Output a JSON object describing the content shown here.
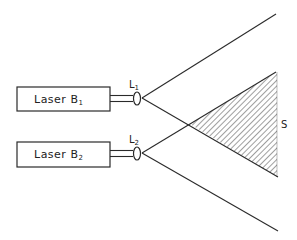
{
  "diagram": {
    "lasers": [
      {
        "name": "Laser B",
        "subscript": "1"
      },
      {
        "name": "Laser B",
        "subscript": "2"
      }
    ],
    "lenses": [
      {
        "name": "L",
        "subscript": "1"
      },
      {
        "name": "L",
        "subscript": "2"
      }
    ],
    "overlap_region_label": "S",
    "colors": {
      "line": "#2a2a2a",
      "background": "#ffffff"
    }
  }
}
